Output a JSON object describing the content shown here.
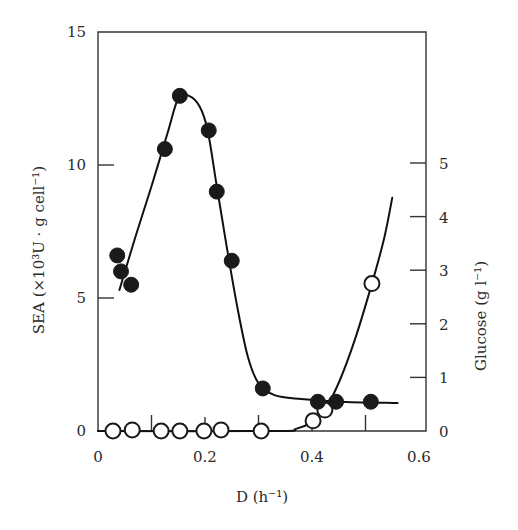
{
  "chart_data": {
    "type": "line",
    "title": "",
    "xlabel": "D (h⁻¹)",
    "ylabel": "SEA (×10³U · g cell⁻¹)",
    "y2label": "Glucose (g l⁻¹)",
    "xlim": [
      0,
      0.6
    ],
    "ylim": [
      0,
      15
    ],
    "y2lim": [
      0,
      7.5
    ],
    "grid": false,
    "legend": null,
    "x_ticks": [
      "0",
      "0.2",
      "0.4",
      "0.6"
    ],
    "x_minor_ticks": [
      0.1,
      0.3,
      0.5
    ],
    "y_ticks": [
      "0",
      "5",
      "10",
      "15"
    ],
    "y2_ticks": [
      "0",
      "1",
      "2",
      "3",
      "4",
      "5"
    ],
    "series": [
      {
        "name": "SEA",
        "axis": "left",
        "marker": "filled-circle",
        "points": [
          {
            "x": 0.036,
            "y": 6.6
          },
          {
            "x": 0.043,
            "y": 6.0
          },
          {
            "x": 0.062,
            "y": 5.5
          },
          {
            "x": 0.125,
            "y": 10.6
          },
          {
            "x": 0.153,
            "y": 12.6
          },
          {
            "x": 0.207,
            "y": 11.3
          },
          {
            "x": 0.222,
            "y": 9.0
          },
          {
            "x": 0.25,
            "y": 6.4
          },
          {
            "x": 0.308,
            "y": 1.6
          },
          {
            "x": 0.411,
            "y": 1.1
          },
          {
            "x": 0.445,
            "y": 1.1
          },
          {
            "x": 0.51,
            "y": 1.1
          }
        ],
        "fit_curve": [
          [
            0.04,
            5.3
          ],
          [
            0.07,
            7.3
          ],
          [
            0.1,
            9.2
          ],
          [
            0.13,
            11.2
          ],
          [
            0.15,
            12.5
          ],
          [
            0.17,
            12.6
          ],
          [
            0.19,
            12.2
          ],
          [
            0.205,
            11.3
          ],
          [
            0.222,
            9.2
          ],
          [
            0.24,
            7.0
          ],
          [
            0.26,
            4.7
          ],
          [
            0.28,
            2.8
          ],
          [
            0.3,
            1.8
          ],
          [
            0.33,
            1.35
          ],
          [
            0.38,
            1.2
          ],
          [
            0.45,
            1.1
          ],
          [
            0.56,
            1.05
          ]
        ]
      },
      {
        "name": "Glucose",
        "axis": "right",
        "marker": "open-circle",
        "points": [
          {
            "x": 0.028,
            "y": 0.0
          },
          {
            "x": 0.064,
            "y": 0.02
          },
          {
            "x": 0.118,
            "y": 0.0
          },
          {
            "x": 0.153,
            "y": 0.0
          },
          {
            "x": 0.198,
            "y": 0.0
          },
          {
            "x": 0.23,
            "y": 0.02
          },
          {
            "x": 0.305,
            "y": 0.0
          },
          {
            "x": 0.402,
            "y": 0.19
          },
          {
            "x": 0.424,
            "y": 0.39
          },
          {
            "x": 0.512,
            "y": 2.75
          }
        ],
        "fit_curve": [
          [
            0.0,
            0.0
          ],
          [
            0.33,
            0.0
          ],
          [
            0.37,
            0.04
          ],
          [
            0.4,
            0.17
          ],
          [
            0.425,
            0.42
          ],
          [
            0.45,
            0.9
          ],
          [
            0.48,
            1.7
          ],
          [
            0.512,
            2.75
          ],
          [
            0.535,
            3.6
          ],
          [
            0.55,
            4.35
          ]
        ]
      }
    ]
  }
}
